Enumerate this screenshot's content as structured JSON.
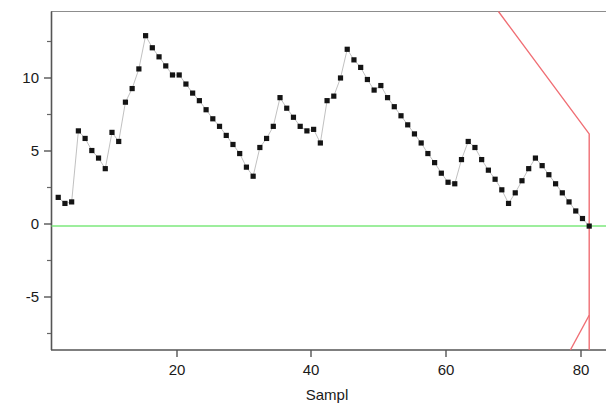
{
  "chart_data": {
    "type": "line",
    "title": "",
    "subtitle": "",
    "xlabel": "Sampl",
    "ylabel": "",
    "xlim": [
      0,
      82.5
    ],
    "ylim": [
      -8.2,
      14.2
    ],
    "grid": false,
    "legend": null,
    "x_ticks": [
      20,
      40,
      60,
      80
    ],
    "x_tick_labels": [
      "20",
      "40",
      "60",
      "80"
    ],
    "x_minor_ticks": [
      10,
      30,
      50,
      70
    ],
    "y_ticks": [
      10,
      5,
      0,
      -5
    ],
    "y_tick_labels": [
      "10",
      "5",
      "0",
      "-5"
    ],
    "y_minor_ticks": [
      12.5,
      7.5,
      2.5,
      -2.5,
      -7.5
    ],
    "colors": {
      "marker": "#141414",
      "connector": "#b9b9b9",
      "center_line": "#7ce87c",
      "control_limits": "#f06e74",
      "axis": "#555555",
      "frame": "#8d8d8d",
      "background": "#ffffff",
      "text": "#1a1a1a"
    },
    "series": [
      {
        "name": "observation",
        "marker": "square",
        "x": [
          1,
          2,
          3,
          4,
          5,
          6,
          7,
          8,
          9,
          10,
          11,
          12,
          13,
          14,
          15,
          16,
          17,
          18,
          19,
          20,
          21,
          22,
          23,
          24,
          25,
          26,
          27,
          28,
          29,
          30,
          31,
          32,
          33,
          34,
          35,
          36,
          37,
          38,
          39,
          40,
          41,
          42,
          43,
          44,
          45,
          46,
          47,
          48,
          49,
          50,
          51,
          52,
          53,
          54,
          55,
          56,
          57,
          58,
          59,
          60,
          61,
          62,
          63,
          64,
          65,
          66,
          67,
          68,
          69,
          70,
          71,
          72,
          73,
          74,
          75,
          76,
          77,
          78,
          79,
          80
        ],
        "values": [
          1.9,
          1.5,
          1.6,
          6.3,
          5.8,
          5.0,
          4.5,
          3.8,
          6.2,
          5.6,
          8.2,
          9.1,
          10.4,
          12.6,
          11.8,
          11.2,
          10.6,
          10.0,
          10.0,
          9.4,
          8.8,
          8.3,
          7.7,
          7.1,
          6.6,
          6.0,
          5.4,
          4.8,
          3.9,
          3.3,
          5.2,
          5.8,
          6.6,
          8.5,
          7.8,
          7.2,
          6.6,
          6.3,
          6.4,
          5.5,
          8.3,
          8.6,
          9.8,
          11.7,
          11.0,
          10.5,
          9.7,
          9.0,
          9.3,
          8.5,
          7.9,
          7.3,
          6.7,
          6.1,
          5.5,
          4.8,
          4.2,
          3.5,
          2.9,
          2.8,
          4.4,
          5.6,
          5.2,
          4.4,
          3.7,
          3.1,
          2.4,
          1.5,
          2.2,
          3.0,
          3.8,
          4.5,
          4.0,
          3.4,
          2.8,
          2.2,
          1.6,
          1.0,
          0.5,
          0.0
        ]
      }
    ],
    "reference_lines": [
      {
        "name": "center-line",
        "kind": "horizontal",
        "value": 0,
        "color": "#7ce87c",
        "x_start": 0,
        "x_end": 82.5
      },
      {
        "name": "upper-control-limit",
        "kind": "polyline",
        "color": "#f06e74",
        "points": [
          [
            66.5,
            14.2
          ],
          [
            80.0,
            6.1
          ],
          [
            80.0,
            -8.2
          ]
        ]
      },
      {
        "name": "lower-control-limit",
        "kind": "polyline",
        "color": "#f06e74",
        "points": [
          [
            77.2,
            -8.2
          ],
          [
            80.0,
            -5.9
          ]
        ]
      }
    ],
    "annotations": []
  },
  "axes": {
    "x_axis_title": "Sampl"
  }
}
